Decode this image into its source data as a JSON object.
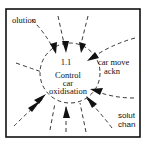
{
  "diagram": {
    "type": "data-flow-process-bubble",
    "process": {
      "number": "1.1",
      "name_lines": [
        "Control",
        "car",
        "oxidisation"
      ]
    },
    "flows": [
      {
        "label": "olution",
        "position": "top-left",
        "direction": "in"
      },
      {
        "label_lines": [
          "car move",
          "ackn"
        ],
        "position": "right-upper",
        "direction": "in"
      },
      {
        "label_lines": [
          "solut",
          "chan"
        ],
        "position": "bottom-right",
        "direction": "in"
      }
    ],
    "unlabeled_incoming_arrows": 9,
    "colors": {
      "stroke": "#111111",
      "background": "#ffffff"
    }
  }
}
